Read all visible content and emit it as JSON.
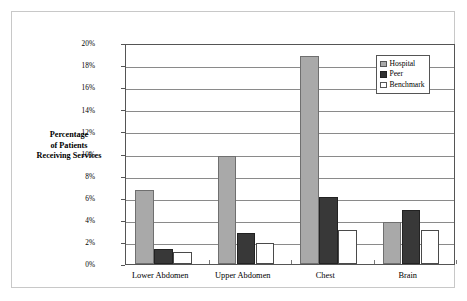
{
  "chart_data": {
    "type": "bar",
    "title": "",
    "subtitle": "",
    "xlabel": "",
    "ylabel": "Percentage of Patients Receiving Services",
    "ylabel_lines": [
      "Percentage",
      "of Patients",
      "Receiving Services"
    ],
    "categories": [
      "Lower Abdomen",
      "Upper Abdomen",
      "Chest",
      "Brain"
    ],
    "series": [
      {
        "name": "Hospital",
        "color": "#a9a9a9",
        "values": [
          6.7,
          9.8,
          18.8,
          3.8
        ]
      },
      {
        "name": "Peer",
        "color": "#383838",
        "values": [
          1.4,
          2.8,
          6.1,
          4.9
        ]
      },
      {
        "name": "Benchmark",
        "color": "#ffffff",
        "values": [
          1.1,
          1.9,
          3.1,
          3.1
        ]
      }
    ],
    "ylim": [
      0,
      20
    ],
    "ytick_step": 2,
    "ytick_labels": [
      "0%",
      "2%",
      "4%",
      "6%",
      "8%",
      "10%",
      "12%",
      "14%",
      "16%",
      "18%",
      "20%"
    ],
    "ytick_values": [
      0,
      2,
      4,
      6,
      8,
      10,
      12,
      14,
      16,
      18,
      20
    ],
    "grid": true,
    "grid_axis": "y",
    "legend_position": "top-right",
    "legend_entries": [
      "Hospital",
      "Peer",
      "Benchmark"
    ],
    "value_unit": "percent"
  }
}
